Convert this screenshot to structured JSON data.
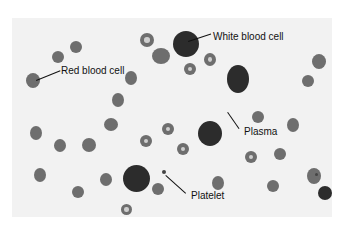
{
  "figure": {
    "type": "blood smear micrograph",
    "labels": [
      {
        "text": "White blood cell",
        "x": 213,
        "y": 32
      },
      {
        "text": "Red blood cell",
        "x": 61,
        "y": 66
      },
      {
        "text": "Plasma",
        "x": 244,
        "y": 127
      },
      {
        "text": "Platelet",
        "x": 191,
        "y": 191
      }
    ]
  }
}
